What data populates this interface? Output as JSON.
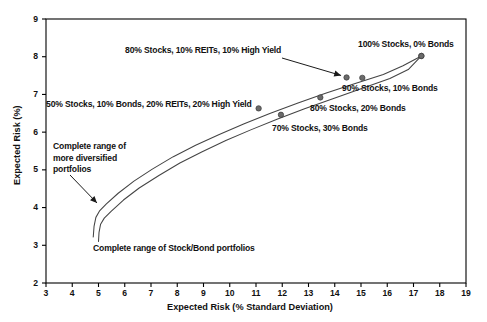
{
  "chart_data": {
    "type": "line",
    "title": "",
    "xlabel": "Expected Risk (% Standard Deviation)",
    "ylabel": "Expected Risk (%)",
    "xlim": [
      3,
      19
    ],
    "ylim": [
      2,
      9
    ],
    "xticks": [
      "3",
      "4",
      "5",
      "6",
      "7",
      "8",
      "9",
      "10",
      "11",
      "12",
      "13",
      "14",
      "15",
      "16",
      "17",
      "18",
      "19"
    ],
    "yticks": [
      "2",
      "3",
      "4",
      "5",
      "6",
      "7",
      "8",
      "9"
    ],
    "grid": false,
    "legend": "none",
    "series": [
      {
        "name": "Complete range of more diversified portfolios",
        "x": [
          4.8,
          4.83,
          4.9,
          5.05,
          5.3,
          5.75,
          6.35,
          7.05,
          7.85,
          8.7,
          9.6,
          10.55,
          11.55,
          12.6,
          13.65,
          14.75,
          15.85,
          16.6,
          17.3
        ],
        "y": [
          3.22,
          3.5,
          3.74,
          3.92,
          4.1,
          4.38,
          4.7,
          5.02,
          5.35,
          5.65,
          5.94,
          6.22,
          6.5,
          6.77,
          7.03,
          7.28,
          7.53,
          7.76,
          8.02
        ],
        "markers": [
          {
            "x": 11.1,
            "y": 6.63,
            "label": "50% Stocks, 10% Bonds, 20% REITs, 20% High Yield"
          },
          {
            "x": 14.45,
            "y": 7.45,
            "label": "80% Stocks, 10% REITs, 10% High Yield"
          },
          {
            "x": 17.3,
            "y": 8.02,
            "label": "100% Stocks, 0% Bonds"
          }
        ]
      },
      {
        "name": "Complete range of Stock/Bond portfolios",
        "x": [
          5.0,
          5.02,
          5.08,
          5.22,
          5.48,
          5.95,
          6.55,
          7.3,
          8.1,
          8.95,
          9.85,
          10.8,
          11.8,
          12.85,
          13.9,
          15.0,
          16.1,
          16.8,
          17.3
        ],
        "y": [
          3.1,
          3.34,
          3.56,
          3.72,
          3.9,
          4.2,
          4.52,
          4.85,
          5.18,
          5.48,
          5.78,
          6.06,
          6.34,
          6.62,
          6.88,
          7.15,
          7.42,
          7.66,
          8.02
        ],
        "markers": [
          {
            "x": 11.95,
            "y": 6.46,
            "label": "70% Stocks, 30% Bonds"
          },
          {
            "x": 13.45,
            "y": 6.92,
            "label": "80% Stocks, 20% Bonds"
          },
          {
            "x": 15.05,
            "y": 7.44,
            "label": "90% Stocks, 10% Bonds"
          },
          {
            "x": 17.3,
            "y": 8.02,
            "label": "100% Stocks, 0% Bonds"
          }
        ]
      }
    ],
    "annotations": [
      {
        "id": "anno-diversified-blend",
        "text": "80% Stocks, 10% REITs, 10% High Yield",
        "arrow": true
      },
      {
        "id": "anno-100-stocks",
        "text": "100% Stocks, 0% Bonds",
        "arrow": false
      },
      {
        "id": "anno-50-stocks-blend",
        "text": "50% Stocks, 10% Bonds, 20% REITs, 20% High Yield",
        "arrow": false
      },
      {
        "id": "anno-90-10",
        "text": "90% Stocks, 10% Bonds",
        "arrow": false
      },
      {
        "id": "anno-80-20",
        "text": "80% Stocks, 20% Bonds",
        "arrow": false
      },
      {
        "id": "anno-70-30",
        "text": "70% Stocks, 30% Bonds",
        "arrow": false
      },
      {
        "id": "anno-range-diversified-l1",
        "text": "Complete range of",
        "arrow": true
      },
      {
        "id": "anno-range-diversified-l2",
        "text": "more diversified",
        "arrow": false
      },
      {
        "id": "anno-range-diversified-l3",
        "text": "portfolios",
        "arrow": false
      },
      {
        "id": "anno-range-stockbond",
        "text": "Complete range of Stock/Bond portfolios",
        "arrow": false
      }
    ],
    "colors": {
      "axis": "#000000",
      "curve": "#444444",
      "marker": "#6b6b6b",
      "text": "#111111",
      "background": "#ffffff"
    }
  }
}
